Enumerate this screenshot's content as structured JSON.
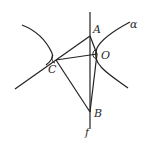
{
  "diagram": {
    "labels": {
      "A": "A",
      "O": "O",
      "C": "C",
      "B": "B",
      "f": "f",
      "alpha": "α"
    },
    "stroke_color": "#222222",
    "background": "#ffffff"
  }
}
